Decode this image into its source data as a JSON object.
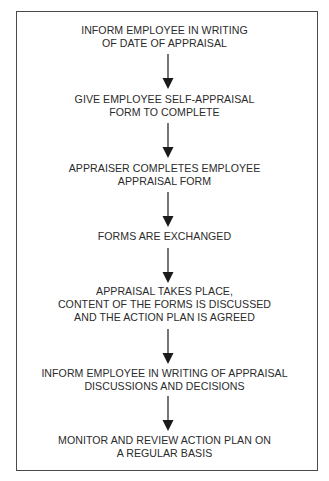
{
  "flowchart": {
    "steps": [
      {
        "id": 1,
        "lines": [
          "INFORM EMPLOYEE IN WRITING",
          "OF DATE OF APPRAISAL"
        ]
      },
      {
        "id": 2,
        "lines": [
          "GIVE EMPLOYEE SELF-APPRAISAL",
          "FORM TO COMPLETE"
        ]
      },
      {
        "id": 3,
        "lines": [
          "APPRAISER COMPLETES EMPLOYEE",
          "APPRAISAL FORM"
        ]
      },
      {
        "id": 4,
        "lines": [
          "FORMS ARE EXCHANGED"
        ]
      },
      {
        "id": 5,
        "lines": [
          "APPRAISAL TAKES PLACE,",
          "CONTENT OF THE FORMS IS DISCUSSED",
          "AND THE ACTION PLAN IS AGREED"
        ]
      },
      {
        "id": 6,
        "lines": [
          "INFORM EMPLOYEE IN WRITING OF APPRAISAL",
          "DISCUSSIONS AND DECISIONS"
        ]
      },
      {
        "id": 7,
        "lines": [
          "MONITOR AND REVIEW ACTION PLAN ON",
          "A REGULAR BASIS"
        ]
      }
    ],
    "connectors": [
      {
        "from": 1,
        "to": 2,
        "icon": "down-arrow-icon"
      },
      {
        "from": 2,
        "to": 3,
        "icon": "down-arrow-icon"
      },
      {
        "from": 3,
        "to": 4,
        "icon": "down-arrow-icon"
      },
      {
        "from": 4,
        "to": 5,
        "icon": "down-arrow-icon"
      },
      {
        "from": 5,
        "to": 6,
        "icon": "down-arrow-icon"
      },
      {
        "from": 6,
        "to": 7,
        "icon": "down-arrow-icon"
      }
    ],
    "colors": {
      "text": "#2b2b2b",
      "frame": "#4a4a4a",
      "arrow": "#1a1a1a",
      "background": "#ffffff"
    }
  }
}
